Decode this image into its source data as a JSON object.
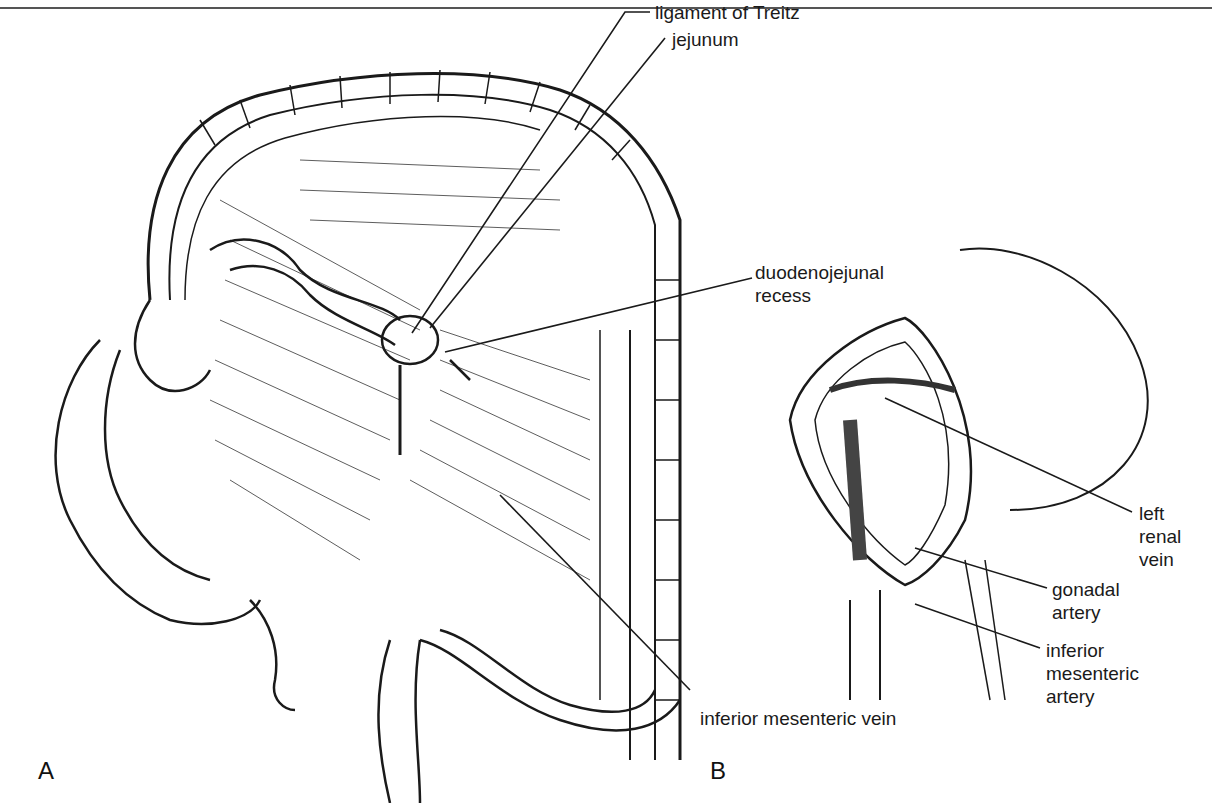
{
  "figure": {
    "panels": [
      {
        "id": "A",
        "label": "A"
      },
      {
        "id": "B",
        "label": "B"
      }
    ],
    "labels": {
      "ligament_of_treitz": "ligament of Treitz",
      "jejunum": "jejunum",
      "duodenojejunal_recess_1": "duodenojejunal",
      "duodenojejunal_recess_2": "recess",
      "left_renal_vein_1": "left",
      "left_renal_vein_2": "renal",
      "left_renal_vein_3": "vein",
      "gonadal_artery_1": "gonadal",
      "gonadal_artery_2": "artery",
      "inferior_mesenteric_artery_1": "inferior",
      "inferior_mesenteric_artery_2": "mesenteric",
      "inferior_mesenteric_artery_3": "artery",
      "inferior_mesenteric_vein": "inferior mesenteric vein"
    },
    "colors": {
      "ink": "#1a1a1a",
      "paper": "#ffffff",
      "rule": "#555555"
    }
  }
}
